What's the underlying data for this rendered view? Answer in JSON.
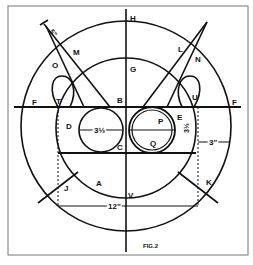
{
  "figure": {
    "caption": "FIG.2",
    "colors": {
      "ink": "#111111",
      "paper": "#ffffff",
      "frame": "#555555"
    }
  },
  "labels": {
    "H": "H",
    "G": "G",
    "F_left": "F",
    "F_right": "F",
    "B": "B",
    "C": "C",
    "D": "D",
    "E": "E",
    "P": "P",
    "Q": "Q",
    "T": "T",
    "U": "U",
    "M": "M",
    "N": "N",
    "O": "O",
    "L": "L",
    "J": "J",
    "K": "K",
    "A": "A",
    "V": "V",
    "S": "S"
  },
  "dimensions": {
    "circle_d_diameter": "3½",
    "circle_p_diameter": "3½",
    "rim_width": "3\"",
    "span": "12\"",
    "horn_tip": "5\""
  }
}
